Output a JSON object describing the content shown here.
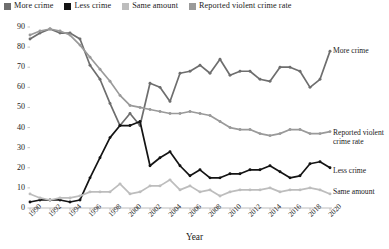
{
  "legend": {
    "items": [
      {
        "label": "More crime",
        "color": "#6e6e6e",
        "icon": "square-swatch-icon"
      },
      {
        "label": "Less crime",
        "color": "#141414",
        "icon": "square-swatch-icon"
      },
      {
        "label": "Same amount",
        "color": "#bdbdbd",
        "icon": "square-swatch-icon"
      },
      {
        "label": "Reported violent crime rate",
        "color": "#9a9a9a",
        "icon": "square-swatch-icon"
      }
    ]
  },
  "axis": {
    "x_title": "Year",
    "y_ticks": [
      "90",
      "80",
      "70",
      "60",
      "50",
      "40",
      "30",
      "20",
      "10",
      "0"
    ],
    "x_ticks": [
      "1990",
      "1992",
      "1994",
      "1996",
      "1998",
      "2000",
      "2002",
      "2004",
      "2006",
      "2008",
      "2010",
      "2012",
      "2014",
      "2016",
      "2018",
      "2020"
    ]
  },
  "series_labels": [
    {
      "name": "more-crime",
      "text": "More crime"
    },
    {
      "name": "reported-violent-crime-rate",
      "text": "Reported violent"
    },
    {
      "name": "reported-violent-crime-rate-2",
      "text": "crime rate"
    },
    {
      "name": "less-crime",
      "text": "Less crime"
    },
    {
      "name": "same-amount",
      "text": "Same amount"
    }
  ],
  "chart_data": {
    "type": "line",
    "title": "",
    "xlabel": "Year",
    "ylabel": "",
    "xlim": [
      1990,
      2020
    ],
    "ylim": [
      0,
      90
    ],
    "grid": false,
    "legend_position": "top-left",
    "x": [
      1990,
      1991,
      1992,
      1993,
      1994,
      1995,
      1996,
      1997,
      1998,
      1999,
      2000,
      2001,
      2002,
      2003,
      2004,
      2005,
      2006,
      2007,
      2008,
      2009,
      2010,
      2011,
      2012,
      2013,
      2014,
      2015,
      2016,
      2017,
      2018,
      2019,
      2020
    ],
    "series": [
      {
        "name": "More crime",
        "color": "#6e6e6e",
        "values": [
          84,
          87,
          89,
          87,
          87,
          84,
          71,
          64,
          52,
          41,
          47,
          41,
          62,
          60,
          53,
          67,
          68,
          71,
          67,
          74,
          66,
          68,
          68,
          64,
          63,
          70,
          70,
          68,
          60,
          64,
          78
        ]
      },
      {
        "name": "Less crime",
        "color": "#141414",
        "values": [
          3,
          4,
          4,
          4,
          3,
          4,
          15,
          25,
          35,
          41,
          41,
          43,
          21,
          25,
          28,
          21,
          16,
          19,
          15,
          15,
          17,
          17,
          19,
          19,
          21,
          18,
          15,
          16,
          22,
          23,
          20
        ]
      },
      {
        "name": "Same amount",
        "color": "#bdbdbd",
        "values": [
          7,
          5,
          4,
          5,
          5,
          6,
          8,
          8,
          8,
          12,
          7,
          8,
          11,
          11,
          14,
          9,
          11,
          8,
          9,
          6,
          8,
          9,
          9,
          9,
          10,
          8,
          9,
          9,
          10,
          9,
          7
        ]
      },
      {
        "name": "Reported violent crime rate",
        "color": "#9a9a9a",
        "values": [
          86,
          88,
          89,
          88,
          86,
          81,
          75,
          69,
          63,
          56,
          51,
          50,
          49,
          48,
          47,
          47,
          48,
          47,
          46,
          43,
          40,
          39,
          39,
          37,
          36,
          37,
          39,
          39,
          37,
          37,
          38
        ]
      }
    ]
  }
}
